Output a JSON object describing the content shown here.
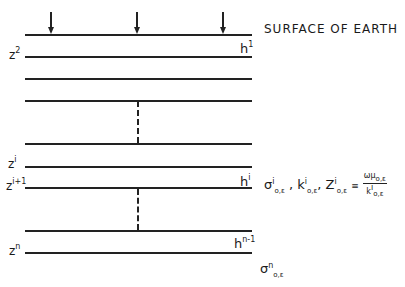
{
  "diagram": {
    "surface_label": "SURFACE OF EARTH",
    "arrows": [
      {
        "x": 51
      },
      {
        "x": 137
      },
      {
        "x": 223
      }
    ],
    "layers": [
      {
        "y": 34,
        "left_label": "",
        "right_label": ""
      },
      {
        "y": 56,
        "left_label": "z",
        "left_sup": "2",
        "right_label": ""
      },
      {
        "y": 78
      },
      {
        "y": 100
      },
      {
        "y": 143
      },
      {
        "y": 166,
        "left_label": "z",
        "left_sup": "i"
      },
      {
        "y": 187,
        "left_label": "z",
        "left_sup": "i+1"
      },
      {
        "y": 230
      },
      {
        "y": 252,
        "left_label": "z",
        "left_sup": "n"
      }
    ],
    "h_labels": [
      {
        "base": "h",
        "sup": "1"
      },
      {
        "base": "h",
        "sup": "i"
      },
      {
        "base": "h",
        "sup": "n-1"
      }
    ],
    "z_labels": {
      "z2": {
        "base": "z",
        "sup": "2"
      },
      "zi": {
        "base": "z",
        "sup": "i"
      },
      "zi1": {
        "base": "z",
        "sup": "i+1"
      },
      "zn": {
        "base": "z",
        "sup": "n"
      }
    },
    "layer_i_params": {
      "sigma": "σ",
      "sigma_sup": "i",
      "sigma_sub": "o,ε",
      "k": "k",
      "k_sup": "i",
      "k_sub": "o,ε",
      "Z": "Z",
      "Z_sup": "i",
      "Z_sub": "o,ε",
      "equiv": "≡",
      "frac_num": "ωμ",
      "frac_num_sub": "o,ε",
      "frac_den": "k",
      "frac_den_sup": "i",
      "frac_den_sub": "o,ε",
      "sep": ","
    },
    "bottom_params": {
      "sigma": "σ",
      "sup": "n",
      "sub": "o,ε"
    }
  }
}
